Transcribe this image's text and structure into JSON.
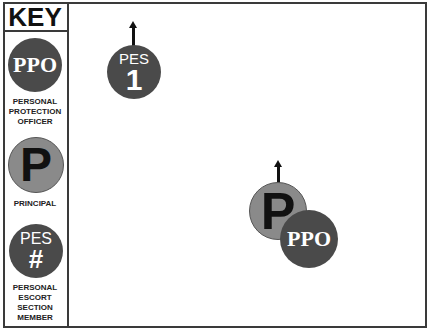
{
  "key": {
    "title": "KEY",
    "items": [
      {
        "symbol": "PPO",
        "label_lines": [
          "PERSONAL",
          "PROTECTION",
          "OFFICER"
        ]
      },
      {
        "symbol": "P",
        "label_lines": [
          "PRINCIPAL"
        ]
      },
      {
        "symbol_top": "PES",
        "symbol_bottom": "#",
        "label_lines": [
          "PERSONAL",
          "ESCORT",
          "SECTION",
          "MEMBER"
        ]
      }
    ]
  },
  "scene": {
    "pes_unit": {
      "top": "PES",
      "number": "1",
      "direction": "up-arrow"
    },
    "principal": {
      "symbol": "P",
      "direction": "up-arrow"
    },
    "ppo": {
      "symbol": "PPO"
    }
  },
  "colors": {
    "dark_token": "#4a4a4a",
    "principal_token": "#8a8a8a",
    "border": "#3a3a3a"
  }
}
